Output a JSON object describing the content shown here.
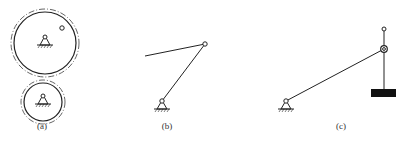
{
  "figure": {
    "panels": [
      {
        "id": "a",
        "label": "(a)",
        "description": "Two meshing circles (gears) each with a fixed ground pivot; upper circle has a small pin near its rim"
      },
      {
        "id": "b",
        "label": "(b)",
        "description": "Two-link arm: ground pivot, link to pinned joint, second link extending left"
      },
      {
        "id": "c",
        "label": "(c)",
        "description": "Ground-pivoted link connected to a slider on a vertical rod, with a rectangular block at the bottom of the rod"
      }
    ],
    "colors": {
      "stroke": "#222222",
      "background": "#ffffff",
      "block": "#111111"
    }
  }
}
